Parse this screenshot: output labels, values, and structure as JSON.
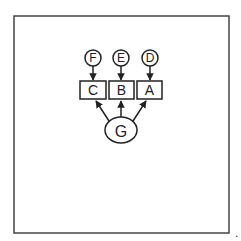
{
  "diagram": {
    "type": "directed-graph",
    "frame": {
      "x": 14,
      "y": 16,
      "w": 215,
      "h": 217,
      "stroke": "#444444"
    },
    "nodes": [
      {
        "id": "F",
        "label": "F",
        "shape": "circle",
        "cx": 93,
        "cy": 58,
        "r": 8
      },
      {
        "id": "E",
        "label": "E",
        "shape": "circle",
        "cx": 121,
        "cy": 58,
        "r": 8
      },
      {
        "id": "D",
        "label": "D",
        "shape": "circle",
        "cx": 150,
        "cy": 58,
        "r": 8
      },
      {
        "id": "C",
        "label": "C",
        "shape": "box",
        "x": 80,
        "y": 81,
        "w": 26,
        "h": 18
      },
      {
        "id": "B",
        "label": "B",
        "shape": "box",
        "x": 109,
        "y": 81,
        "w": 25,
        "h": 18
      },
      {
        "id": "A",
        "label": "A",
        "shape": "box",
        "x": 137,
        "y": 81,
        "w": 25,
        "h": 18
      },
      {
        "id": "G",
        "label": "G",
        "shape": "ellipse",
        "cx": 121,
        "cy": 130,
        "rx": 16,
        "ry": 13
      }
    ],
    "edges": [
      {
        "from": "F",
        "to": "C"
      },
      {
        "from": "E",
        "to": "B"
      },
      {
        "from": "D",
        "to": "A"
      },
      {
        "from": "G",
        "to": "C"
      },
      {
        "from": "G",
        "to": "B"
      },
      {
        "from": "G",
        "to": "A"
      }
    ],
    "trailing_mark": "."
  }
}
